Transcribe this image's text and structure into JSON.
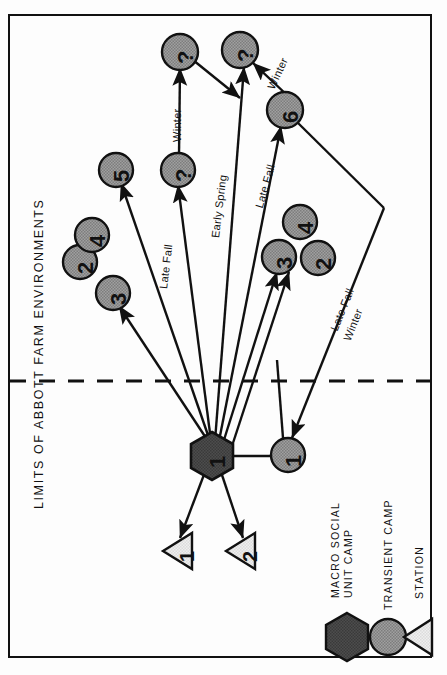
{
  "figure": {
    "title": "LIMITS OF ABBOTT FARM ENVIRONMENTS",
    "orientation": "rotated-90-ccw",
    "boundary_style": "dashed"
  },
  "legend": {
    "items": [
      {
        "label_line1": "MACRO SOCIAL",
        "label_line2": "UNIT CAMP",
        "shape": "hexagon-icon",
        "fill": "#4a4a4a"
      },
      {
        "label_line1": "TRANSIENT CAMP",
        "label_line2": "",
        "shape": "circle-icon",
        "fill": "#9a9a9a"
      },
      {
        "label_line1": "STATION",
        "label_line2": "",
        "shape": "triangle-icon",
        "fill": "#e2e2e2"
      }
    ]
  },
  "nodes": {
    "macro_social_unit_camps": [
      {
        "id": "msu-1",
        "label": "1",
        "x": 212,
        "y": 456,
        "shape": "hexagon"
      }
    ],
    "transient_camps": [
      {
        "id": "tc-1",
        "label": "1",
        "x": 288,
        "y": 455,
        "shape": "circle"
      },
      {
        "id": "tc-2",
        "label": "2",
        "x": 80,
        "y": 262,
        "shape": "circle"
      },
      {
        "id": "tc-4a",
        "label": "4",
        "x": 92,
        "y": 235,
        "shape": "circle"
      },
      {
        "id": "tc-3a",
        "label": "3",
        "x": 113,
        "y": 295,
        "shape": "circle"
      },
      {
        "id": "tc-5",
        "label": "5",
        "x": 116,
        "y": 170,
        "shape": "circle"
      },
      {
        "id": "tc-q1",
        "label": "?",
        "x": 177,
        "y": 170,
        "shape": "circle"
      },
      {
        "id": "tc-q2",
        "label": "?",
        "x": 180,
        "y": 52,
        "shape": "circle"
      },
      {
        "id": "tc-q3",
        "label": "?",
        "x": 240,
        "y": 50,
        "shape": "circle"
      },
      {
        "id": "tc-6",
        "label": "6",
        "x": 284,
        "y": 110,
        "shape": "circle"
      },
      {
        "id": "tc-4b",
        "label": "4",
        "x": 300,
        "y": 222,
        "shape": "circle"
      },
      {
        "id": "tc-3b",
        "label": "3",
        "x": 279,
        "y": 257,
        "shape": "circle"
      },
      {
        "id": "tc-2b",
        "label": "2",
        "x": 318,
        "y": 258,
        "shape": "circle"
      }
    ],
    "stations": [
      {
        "id": "st-1",
        "label": "1",
        "x": 178,
        "y": 551,
        "shape": "triangle"
      },
      {
        "id": "st-2",
        "label": "2",
        "x": 241,
        "y": 551,
        "shape": "triangle"
      }
    ]
  },
  "edge_labels": [
    {
      "text": "Winter",
      "x": 176,
      "y": 120
    },
    {
      "text": "Winter",
      "x": 270,
      "y": 64
    },
    {
      "text": "Late Fall",
      "x": 161,
      "y": 255
    },
    {
      "text": "Early Spring",
      "x": 213,
      "y": 193
    },
    {
      "text": "Late Fall",
      "x": 258,
      "y": 172
    },
    {
      "text": "Late Fall",
      "x": 335,
      "y": 288
    },
    {
      "text": "Winter",
      "x": 345,
      "y": 302
    }
  ],
  "colors": {
    "node_fill": "#9a9a9a",
    "hub_fill": "#4a4a4a",
    "station_fill": "#e8e8e8",
    "stroke": "#111111",
    "background": "#ffffff"
  }
}
